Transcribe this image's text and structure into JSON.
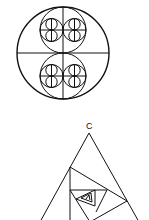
{
  "figure1": {
    "name": "nested circles fractal",
    "outer_circle": {
      "cx": 63,
      "cy": 53,
      "r": 46
    },
    "stroke": "#111111"
  },
  "figure2": {
    "name": "spiral of inscribed triangles",
    "apex_label": "C",
    "stroke": "#111111"
  }
}
